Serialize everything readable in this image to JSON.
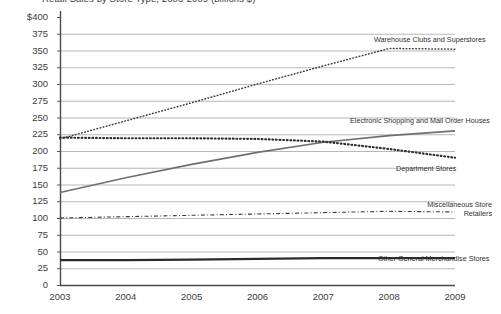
{
  "chart_data": {
    "type": "line",
    "title": "Retail Sales by Store Type, 2003-2009 (billions $)",
    "xlabel": "",
    "ylabel": "",
    "x": [
      2003,
      2004,
      2005,
      2006,
      2007,
      2008,
      2009
    ],
    "categories": [
      "2003",
      "2004",
      "2005",
      "2006",
      "2007",
      "2008",
      "2009"
    ],
    "xtick_labels": [
      "2003",
      "2004",
      "2005",
      "2006",
      "2007",
      "2008",
      "2009"
    ],
    "ytick_labels": [
      "$400",
      "375",
      "350",
      "325",
      "300",
      "275",
      "250",
      "225",
      "200",
      "175",
      "150",
      "125",
      "100",
      "75",
      "50",
      "25",
      "0"
    ],
    "ytick_values": [
      400,
      375,
      350,
      325,
      300,
      275,
      250,
      225,
      200,
      175,
      150,
      125,
      100,
      75,
      50,
      25,
      0
    ],
    "ylim": [
      0,
      400
    ],
    "xlim": [
      2003,
      2009
    ],
    "grid": "horizontal",
    "legend_position": "inline-right-annotations",
    "series": [
      {
        "name": "Warehouse Clubs and Superstores",
        "values": [
          218,
          245,
          272,
          300,
          327,
          353,
          352
        ],
        "style": "dotted",
        "color": "#3c3c3c",
        "label_x": 374,
        "label_y": 36
      },
      {
        "name": "Electronic Shopping and Mail Order Houses",
        "values": [
          138,
          160,
          180,
          198,
          213,
          223,
          230
        ],
        "style": "solid",
        "color": "#6f6f6f",
        "label_x": 350,
        "label_y": 117
      },
      {
        "name": "Department Stores",
        "values": [
          220,
          219,
          219,
          218,
          214,
          203,
          190
        ],
        "style": "bold-dotted",
        "color": "#2e2e2e",
        "label_x": 396,
        "label_y": 165
      },
      {
        "name": "Miscellaneous Store Retailers",
        "values": [
          100,
          102,
          104,
          106,
          108,
          110,
          109
        ],
        "style": "dash-dot",
        "color": "#3c3c3c",
        "label_x": 400,
        "label_y": 201
      },
      {
        "name": "Other General Merchandise Stores",
        "values": [
          37,
          37,
          38,
          39,
          40,
          40,
          40
        ],
        "style": "solid-bold",
        "color": "#2b2b2b",
        "label_x": 378,
        "label_y": 255
      }
    ],
    "axis_color": "#4a4a4a",
    "grid_color": "#9a9a9a",
    "background": "#ffffff"
  }
}
